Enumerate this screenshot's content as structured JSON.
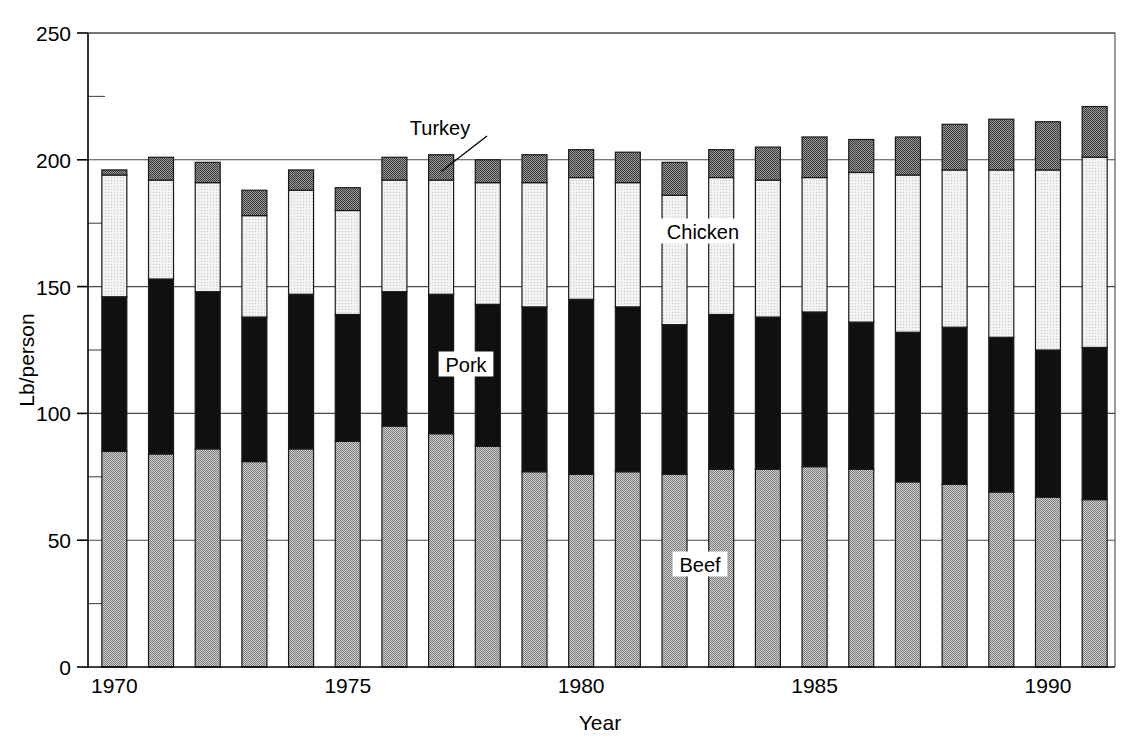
{
  "chart_data": {
    "type": "bar",
    "title": "",
    "subtitle": "",
    "xlabel": "Year",
    "ylabel": "Lb/person",
    "stacked": true,
    "grid": true,
    "legend_position": "inline-annotations",
    "xlim": [
      1969.4,
      1991.6
    ],
    "ylim": [
      0,
      250
    ],
    "ytick_major_step": 50,
    "ytick_minor_step": 25,
    "ytick_labels": [
      "0",
      "50",
      "100",
      "150",
      "200",
      "250"
    ],
    "ytick_values": [
      0,
      50,
      100,
      150,
      200,
      250
    ],
    "xtick_labels": [
      "1970",
      "1975",
      "1980",
      "1985",
      "1990"
    ],
    "xtick_values": [
      1970,
      1975,
      1980,
      1985,
      1990
    ],
    "categories": [
      1970,
      1971,
      1972,
      1973,
      1974,
      1975,
      1976,
      1977,
      1978,
      1979,
      1980,
      1981,
      1982,
      1983,
      1984,
      1985,
      1986,
      1987,
      1988,
      1989,
      1990,
      1991
    ],
    "series": [
      {
        "name": "Beef",
        "color": "#a9a9a9",
        "pattern": "medium-dither",
        "values": [
          85,
          84,
          86,
          81,
          86,
          89,
          95,
          92,
          87,
          77,
          76,
          77,
          76,
          78,
          78,
          79,
          78,
          73,
          72,
          69,
          67,
          66
        ]
      },
      {
        "name": "Pork",
        "color": "#0d0d0d",
        "pattern": "solid-black",
        "values": [
          61,
          69,
          62,
          57,
          61,
          50,
          53,
          55,
          56,
          65,
          69,
          65,
          59,
          61,
          60,
          61,
          58,
          59,
          62,
          61,
          58,
          60
        ]
      },
      {
        "name": "Chicken",
        "color": "#ededed",
        "pattern": "light-dither",
        "values": [
          48,
          39,
          43,
          40,
          41,
          41,
          44,
          45,
          48,
          49,
          48,
          49,
          51,
          54,
          54,
          53,
          59,
          62,
          62,
          66,
          71,
          75
        ]
      },
      {
        "name": "Turkey",
        "color": "#8c8c8c",
        "pattern": "dark-checker",
        "values": [
          2,
          9,
          8,
          10,
          8,
          9,
          9,
          10,
          9,
          11,
          11,
          12,
          13,
          11,
          13,
          16,
          13,
          15,
          18,
          20,
          19,
          20
        ]
      }
    ],
    "totals": [
      196,
      201,
      199,
      188,
      196,
      189,
      201,
      202,
      200,
      202,
      204,
      203,
      199,
      204,
      205,
      209,
      208,
      209,
      214,
      216,
      215,
      221
    ],
    "annotations": [
      {
        "label": "Turkey",
        "target_year": 1977,
        "has_leader": true
      },
      {
        "label": "Chicken",
        "target_year": 1982,
        "has_leader": false
      },
      {
        "label": "Pork",
        "target_year": 1976,
        "has_leader": false
      },
      {
        "label": "Beef",
        "target_year": 1982,
        "has_leader": false
      }
    ]
  }
}
